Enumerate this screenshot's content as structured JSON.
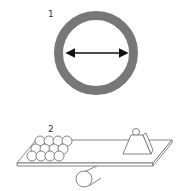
{
  "figures": [
    {
      "label": "1",
      "description": "ring with diameter arrow"
    },
    {
      "label": "2",
      "description": "seesaw lever with stacked balls and weight on a cylinder"
    }
  ],
  "colors": {
    "ring": "#777777",
    "stroke": "#555555",
    "arrow": "#111111",
    "background": "#ffffff"
  }
}
